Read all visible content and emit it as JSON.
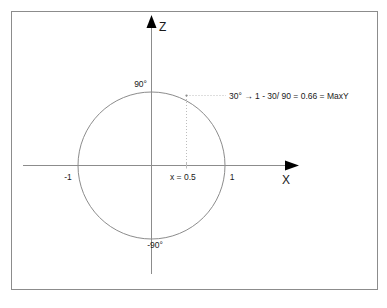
{
  "figure": {
    "border_color": "#8c8c8c",
    "background": "#ffffff",
    "axis_color": "#8c8c8c",
    "circle_color": "#8c8c8c",
    "dotted_color": "#bdbdbd",
    "text_color": "#1a1a1a",
    "arrow_color": "#000000"
  },
  "axes": {
    "x_label": "X",
    "z_label": "Z",
    "x_ticks": [
      {
        "label": "-1",
        "value": -1
      },
      {
        "label": "1",
        "value": 1
      }
    ],
    "z_ticks": [
      {
        "label": "90°",
        "value": 90
      },
      {
        "label": "-90°",
        "value": -90
      }
    ]
  },
  "circle": {
    "radius_label": "1",
    "center_x": 0,
    "center_z": 0
  },
  "marker": {
    "x_label": "x = 0.5",
    "x_value": 0.5
  },
  "annotation": {
    "text": "30° → 1 - 30/ 90 = 0.66 = MaxY",
    "angle_deg": 30,
    "result": 0.66,
    "result_name": "MaxY"
  }
}
